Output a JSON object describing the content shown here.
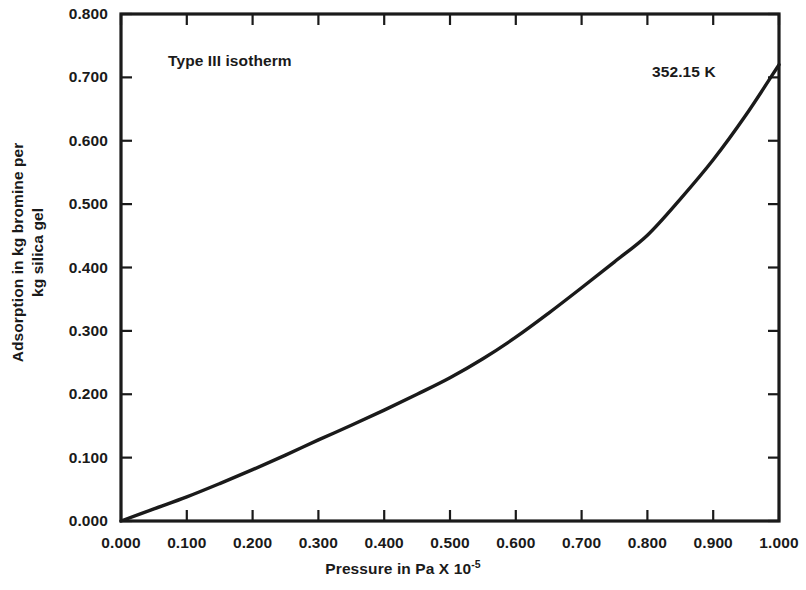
{
  "chart_data": {
    "type": "line",
    "title": "",
    "subtitle": "",
    "xlabel": "Pressure in Pa X 10",
    "xlabel_exponent": "-5",
    "ylabel_line1": "Adsorption in kg bromine per",
    "ylabel_line2": "kg silica gel",
    "xlim": [
      0.0,
      1.0
    ],
    "ylim": [
      0.0,
      0.8
    ],
    "xticks": [
      "0.000",
      "0.100",
      "0.200",
      "0.300",
      "0.400",
      "0.500",
      "0.600",
      "0.700",
      "0.800",
      "0.900",
      "1.000"
    ],
    "xtick_values": [
      0.0,
      0.1,
      0.2,
      0.3,
      0.4,
      0.5,
      0.6,
      0.7,
      0.8,
      0.9,
      1.0
    ],
    "yticks": [
      "0.000",
      "0.100",
      "0.200",
      "0.300",
      "0.400",
      "0.500",
      "0.600",
      "0.700",
      "0.800"
    ],
    "ytick_values": [
      0.0,
      0.1,
      0.2,
      0.3,
      0.4,
      0.5,
      0.6,
      0.7,
      0.8
    ],
    "grid": false,
    "legend": false,
    "annotations": [
      {
        "name": "isotherm-type",
        "text": "Type III isotherm",
        "x": 0.08,
        "y": 0.735
      },
      {
        "name": "temperature",
        "text": "352.15 K",
        "x": 0.815,
        "y": 0.715
      }
    ],
    "series": [
      {
        "name": "352.15 K",
        "color": "#1a1a1a",
        "linewidth": 3.4,
        "x": [
          0.0,
          0.05,
          0.1,
          0.15,
          0.2,
          0.25,
          0.3,
          0.35,
          0.4,
          0.45,
          0.5,
          0.55,
          0.6,
          0.65,
          0.7,
          0.75,
          0.8,
          0.85,
          0.9,
          0.95,
          1.0
        ],
        "values": [
          0.0,
          0.019,
          0.038,
          0.059,
          0.081,
          0.104,
          0.128,
          0.151,
          0.175,
          0.2,
          0.226,
          0.256,
          0.29,
          0.328,
          0.368,
          0.409,
          0.451,
          0.508,
          0.57,
          0.641,
          0.72
        ]
      }
    ]
  },
  "axes": {
    "frame_color": "#1a1a1a",
    "tick_direction": "in"
  }
}
